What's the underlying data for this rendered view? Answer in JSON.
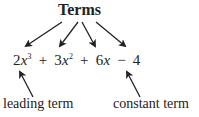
{
  "title": "Terms",
  "expression": {
    "terms": [
      {
        "coef": "2",
        "var": "x",
        "exp": "3"
      },
      {
        "op": "+",
        "coef": "3",
        "var": "x",
        "exp": "2"
      },
      {
        "op": "+",
        "coef": "6",
        "var": "x",
        "exp": ""
      },
      {
        "op": "−",
        "coef": "4",
        "var": "",
        "exp": ""
      }
    ]
  },
  "labels": {
    "leading": "leading term",
    "constant": "constant term"
  },
  "colors": {
    "text": "#222222",
    "arrow": "#222222",
    "background": "#ffffff"
  }
}
